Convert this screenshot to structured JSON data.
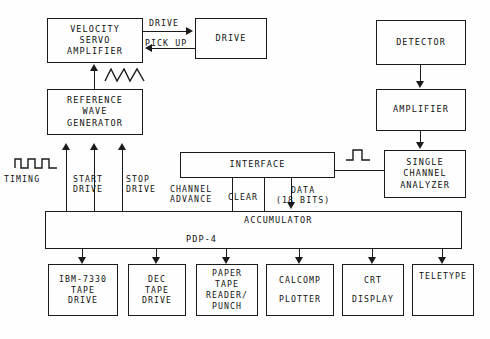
{
  "diagram": {
    "background_color": "#fefefe",
    "line_color": "#1a1a1a",
    "boxes": [
      {
        "id": "velocity-servo-amplifier",
        "lines": [
          "VELOCITY",
          "SERVO",
          "AMPLIFIER"
        ],
        "x": 47,
        "y": 18,
        "w": 96,
        "h": 45,
        "font": 8.5
      },
      {
        "id": "drive",
        "lines": [
          "DRIVE"
        ],
        "x": 195,
        "y": 18,
        "w": 72,
        "h": 41,
        "font": 8.5
      },
      {
        "id": "reference-wave-generator",
        "lines": [
          "REFERENCE",
          "WAVE",
          "GENERATOR"
        ],
        "x": 47,
        "y": 89,
        "w": 96,
        "h": 46,
        "font": 8.5
      },
      {
        "id": "detector",
        "lines": [
          "DETECTOR"
        ],
        "x": 376,
        "y": 20,
        "w": 90,
        "h": 45,
        "font": 8.5
      },
      {
        "id": "amplifier",
        "lines": [
          "AMPLIFIER"
        ],
        "x": 376,
        "y": 89,
        "w": 90,
        "h": 42,
        "font": 8.5
      },
      {
        "id": "single-channel-analyzer",
        "lines": [
          "SINGLE",
          "CHANNEL",
          "ANALYZER"
        ],
        "x": 384,
        "y": 150,
        "w": 82,
        "h": 48,
        "font": 8.5
      },
      {
        "id": "ibm-7330-tape-drive",
        "lines": [
          "IBM-7330",
          "TAPE",
          "DRIVE"
        ],
        "x": 48,
        "y": 264,
        "w": 70,
        "h": 52,
        "font": 8.2
      },
      {
        "id": "dec-tape-drive",
        "lines": [
          "DEC",
          "TAPE",
          "DRIVE"
        ],
        "x": 128,
        "y": 264,
        "w": 58,
        "h": 52,
        "font": 8.2
      },
      {
        "id": "paper-tape-reader-punch",
        "lines": [
          "PAPER",
          "TAPE",
          "READER/",
          "PUNCH"
        ],
        "x": 196,
        "y": 264,
        "w": 62,
        "h": 52,
        "font": 8.2
      },
      {
        "id": "calcomp-plotter",
        "lines": [
          "CALCOMP",
          "",
          "PLOTTER"
        ],
        "x": 266,
        "y": 264,
        "w": 68,
        "h": 52,
        "font": 8.2
      },
      {
        "id": "crt-display",
        "lines": [
          "CRT",
          "",
          "DISPLAY"
        ],
        "x": 342,
        "y": 264,
        "w": 62,
        "h": 52,
        "font": 8.2
      },
      {
        "id": "teletype",
        "lines": [
          "TELETYPE"
        ],
        "x": 412,
        "y": 264,
        "w": 62,
        "h": 52,
        "font": 8.2
      }
    ],
    "interface_box": {
      "id": "interface",
      "label": "INTERFACE",
      "x": 180,
      "y": 152,
      "w": 155,
      "h": 26,
      "font": 8.5
    },
    "computer_box": {
      "id": "pdp-4-accumulator",
      "x": 45,
      "y": 211,
      "w": 417,
      "h": 38,
      "accumulator_label": "ACCUMULATOR",
      "pdp_label": "PDP-4",
      "font": 8.5
    },
    "signal_labels": [
      {
        "id": "drive-signal",
        "text": "DRIVE",
        "x": 149,
        "y": 18,
        "font": 8.2
      },
      {
        "id": "pick-up-signal",
        "text": "PICK UP",
        "x": 145,
        "y": 38,
        "font": 8.2
      },
      {
        "id": "timing-signal",
        "text": "TIMING",
        "x": 4,
        "y": 174,
        "font": 8.2
      },
      {
        "id": "start-drive-signal",
        "lines": [
          "START",
          "DRIVE"
        ],
        "x": 75,
        "y": 174,
        "font": 8.2
      },
      {
        "id": "stop-drive-signal",
        "lines": [
          "STOP",
          "DRIVE"
        ],
        "x": 128,
        "y": 174,
        "font": 8.2
      },
      {
        "id": "channel-advance-signal",
        "lines": [
          "CHANNEL",
          "ADVANCE"
        ],
        "x": 172,
        "y": 182,
        "font": 8.2
      },
      {
        "id": "clear-signal",
        "text": "CLEAR",
        "x": 230,
        "y": 191,
        "font": 8.2
      },
      {
        "id": "data-signal",
        "lines": [
          "DATA",
          "(18 BITS)",
          "_18bits_"
        ],
        "x": 280,
        "y": 184,
        "font": 8.2
      }
    ],
    "waveforms": [
      {
        "id": "timing-square-wave-icon",
        "x": 14,
        "y": 158,
        "type": "square-pulse-train"
      },
      {
        "id": "reference-triangle-wave-icon",
        "x": 104,
        "y": 68,
        "type": "triangle-wave"
      },
      {
        "id": "analyzer-pulse-icon",
        "x": 345,
        "y": 149,
        "type": "single-pulse"
      }
    ]
  }
}
